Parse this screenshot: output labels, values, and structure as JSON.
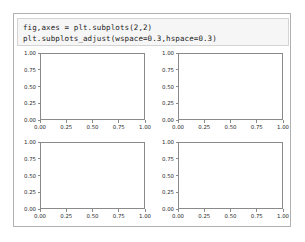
{
  "notebook": {
    "code_cell": {
      "lines": [
        "fig,axes = plt.subplots(2,2)",
        "plt.subplots_adjust(wspace=0.3,hspace=0.3)"
      ]
    }
  },
  "colors": {
    "cell_background": "#f6f6f6",
    "cell_border": "#d4d4d4",
    "frame_border": "#b0b0b0",
    "axes_spine": "#8a8a8a",
    "tick_label": "#2b2b2b",
    "figure_background": "#ffffff"
  },
  "chart_data": {
    "type": "line",
    "title": "",
    "xlabel": "",
    "ylabel": "",
    "grid": false,
    "legend": null,
    "layout": {
      "rows": 2,
      "cols": 2,
      "wspace": 0.3,
      "hspace": 0.3
    },
    "xlim": [
      0.0,
      1.0
    ],
    "ylim": [
      0.0,
      1.0
    ],
    "xticks": [
      0.0,
      0.25,
      0.5,
      0.75,
      1.0
    ],
    "yticks": [
      0.0,
      0.25,
      0.5,
      0.75,
      1.0
    ],
    "xticklabels": [
      "0.00",
      "0.25",
      "0.50",
      "0.75",
      "1.00"
    ],
    "yticklabels": [
      "0.00",
      "0.25",
      "0.50",
      "0.75",
      "1.00"
    ],
    "subplots": [
      {
        "index": 0,
        "position": "top-left",
        "series": [],
        "values": []
      },
      {
        "index": 1,
        "position": "top-right",
        "series": [],
        "values": []
      },
      {
        "index": 2,
        "position": "bottom-left",
        "series": [],
        "values": []
      },
      {
        "index": 3,
        "position": "bottom-right",
        "series": [],
        "values": []
      }
    ]
  }
}
